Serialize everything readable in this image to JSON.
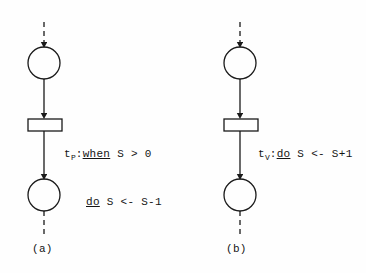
{
  "figure": {
    "background_color": "#fefefe",
    "ink_color": "#1a1a1a",
    "panels": [
      {
        "id": "a",
        "caption": "(a)",
        "transition_label": {
          "name": "t",
          "subscript": "P",
          "separator": ":",
          "line1_keyword": "when",
          "line1_rest": " S > 0",
          "line2_keyword": "do",
          "line2_rest": " S <- S-1",
          "full_text": "t_P: when S > 0  do S <- S-1"
        },
        "nodes": [
          {
            "type": "place",
            "id": "place-in-a",
            "cx": 44,
            "cy": 63,
            "r": 16
          },
          {
            "type": "transition",
            "id": "transition-tp",
            "x": 28,
            "y": 119,
            "w": 34,
            "h": 12
          },
          {
            "type": "place",
            "id": "place-out-a",
            "cx": 44,
            "cy": 195,
            "r": 16
          }
        ],
        "arcs": [
          {
            "id": "arc-dashed-in-a",
            "style": "dashed",
            "from_y": 22,
            "to_y": 47
          },
          {
            "id": "arc-place-to-transition-a",
            "style": "solid",
            "from_y": 79,
            "to_y": 118
          },
          {
            "id": "arc-transition-to-place-a",
            "style": "solid",
            "from_y": 131,
            "to_y": 179
          },
          {
            "id": "arc-dashed-out-a",
            "style": "dashed",
            "from_y": 211,
            "to_y": 236
          }
        ]
      },
      {
        "id": "b",
        "caption": "(b)",
        "transition_label": {
          "name": "t",
          "subscript": "V",
          "separator": ":",
          "line1_keyword": "do",
          "line1_rest": " S <- S+1",
          "full_text": "t_V: do S <- S+1"
        },
        "nodes": [
          {
            "type": "place",
            "id": "place-in-b",
            "cx": 240,
            "cy": 63,
            "r": 16
          },
          {
            "type": "transition",
            "id": "transition-tv",
            "x": 224,
            "y": 119,
            "w": 34,
            "h": 12
          },
          {
            "type": "place",
            "id": "place-out-b",
            "cx": 240,
            "cy": 195,
            "r": 16
          }
        ],
        "arcs": [
          {
            "id": "arc-dashed-in-b",
            "style": "dashed",
            "from_y": 22,
            "to_y": 47
          },
          {
            "id": "arc-place-to-transition-b",
            "style": "solid",
            "from_y": 79,
            "to_y": 118
          },
          {
            "id": "arc-transition-to-place-b",
            "style": "solid",
            "from_y": 131,
            "to_y": 179
          },
          {
            "id": "arc-dashed-out-b",
            "style": "dashed",
            "from_y": 211,
            "to_y": 236
          }
        ]
      }
    ]
  }
}
